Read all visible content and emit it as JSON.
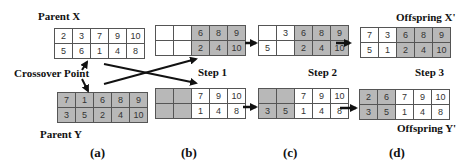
{
  "labels": {
    "parent_x": "Parent X",
    "parent_y": "Parent Y",
    "crossover_point": "Crossover Point",
    "step1": "Step 1",
    "step2": "Step 2",
    "step3": "Step 3",
    "offspring_x": "Offspring X'",
    "offspring_y": "Offspring Y'"
  },
  "panels": [
    "(a)",
    "(b)",
    "(c)",
    "(d)"
  ],
  "grids": {
    "parent_x": {
      "rows": [
        [
          "2",
          "3",
          "7",
          "9",
          "10"
        ],
        [
          "5",
          "6",
          "1",
          "4",
          "8"
        ]
      ],
      "shade": [
        [
          "w",
          "w",
          "w",
          "w",
          "w"
        ],
        [
          "w",
          "w",
          "w",
          "w",
          "w"
        ]
      ]
    },
    "parent_y": {
      "rows": [
        [
          "7",
          "1",
          "6",
          "8",
          "9"
        ],
        [
          "3",
          "5",
          "2",
          "4",
          "10"
        ]
      ],
      "shade": [
        [
          "g",
          "g",
          "g",
          "g",
          "g"
        ],
        [
          "g",
          "g",
          "g",
          "g",
          "g"
        ]
      ]
    },
    "b_top": {
      "rows": [
        [
          "",
          "",
          "6",
          "8",
          "9"
        ],
        [
          "",
          "",
          "2",
          "4",
          "10"
        ]
      ],
      "shade": [
        [
          "w",
          "w",
          "g",
          "g",
          "g"
        ],
        [
          "w",
          "w",
          "g",
          "g",
          "g"
        ]
      ]
    },
    "b_bottom": {
      "rows": [
        [
          "",
          "",
          "7",
          "9",
          "10"
        ],
        [
          "",
          "",
          "1",
          "4",
          "8"
        ]
      ],
      "shade": [
        [
          "g",
          "g",
          "w",
          "w",
          "w"
        ],
        [
          "g",
          "g",
          "w",
          "w",
          "w"
        ]
      ]
    },
    "c_top": {
      "rows": [
        [
          "",
          "3",
          "6",
          "8",
          "9"
        ],
        [
          "5",
          "",
          "2",
          "4",
          "10"
        ]
      ],
      "shade": [
        [
          "w",
          "w",
          "g",
          "g",
          "g"
        ],
        [
          "w",
          "w",
          "g",
          "g",
          "g"
        ]
      ]
    },
    "c_bottom": {
      "rows": [
        [
          "",
          "",
          "7",
          "9",
          "10"
        ],
        [
          "3",
          "5",
          "1",
          "4",
          "8"
        ]
      ],
      "shade": [
        [
          "g",
          "g",
          "w",
          "w",
          "w"
        ],
        [
          "g",
          "g",
          "w",
          "w",
          "w"
        ]
      ]
    },
    "offspring_x": {
      "rows": [
        [
          "7",
          "3",
          "6",
          "8",
          "9"
        ],
        [
          "5",
          "1",
          "2",
          "4",
          "10"
        ]
      ],
      "shade": [
        [
          "w",
          "w",
          "g",
          "g",
          "g"
        ],
        [
          "w",
          "w",
          "g",
          "g",
          "g"
        ]
      ]
    },
    "offspring_y": {
      "rows": [
        [
          "2",
          "6",
          "7",
          "9",
          "10"
        ],
        [
          "3",
          "5",
          "1",
          "4",
          "8"
        ]
      ],
      "shade": [
        [
          "g",
          "g",
          "w",
          "w",
          "w"
        ],
        [
          "g",
          "g",
          "w",
          "w",
          "w"
        ]
      ]
    }
  },
  "colors": {
    "shaded_cell": "#b8b8b8",
    "border": "#555555",
    "arrow": "#111111"
  }
}
